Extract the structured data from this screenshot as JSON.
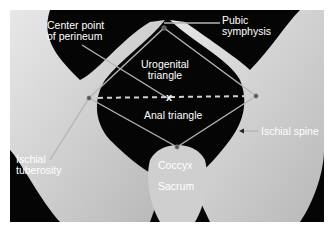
{
  "figure": {
    "labels": {
      "center_point": [
        "Center point",
        "of perineum"
      ],
      "pubic_symphysis": [
        "Pubic",
        "symphysis"
      ],
      "urogenital_triangle": [
        "Urogenital",
        "triangle"
      ],
      "anal_triangle": "Anal triangle",
      "ischial_spine": "Ischial spine",
      "ischial_tuberosity": [
        "Ischial",
        "tuberosity"
      ],
      "coccyx": "Coccyx",
      "sacrum": "Sacrum",
      "center_marker": "x"
    },
    "colors": {
      "background": "#050505",
      "bone": "#d9d9d9",
      "lines": "#b5b5b5",
      "label": "#ffffff"
    }
  }
}
